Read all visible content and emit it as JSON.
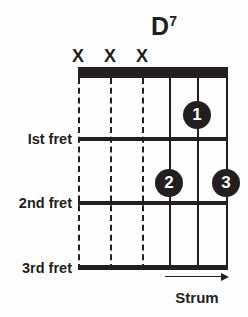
{
  "diagram": {
    "kind": "guitar-chord-diagram",
    "title": {
      "root": "D",
      "superscript": "7",
      "full": "D7"
    },
    "colors": {
      "ink": "#231f20",
      "background": "#fdfdfd",
      "dot_text": "#ffffff"
    },
    "strings": [
      {
        "index": 1,
        "x": 78,
        "style": "dashed",
        "marker": "X",
        "label": "X"
      },
      {
        "index": 2,
        "x": 110,
        "style": "dashed",
        "marker": "X",
        "label": "X"
      },
      {
        "index": 3,
        "x": 142,
        "style": "dashed",
        "marker": "X",
        "label": "X"
      },
      {
        "index": 4,
        "x": 169,
        "style": "solid",
        "marker": "",
        "label": ""
      },
      {
        "index": 5,
        "x": 197,
        "style": "solid",
        "marker": "",
        "label": ""
      },
      {
        "index": 6,
        "x": 226,
        "style": "solid",
        "marker": "",
        "label": ""
      }
    ],
    "nut": {
      "x": 78,
      "y": 67,
      "width": 150,
      "height": 11
    },
    "frets": [
      {
        "number": 1,
        "label": "Ist fret",
        "y": 137,
        "thickness": 4
      },
      {
        "number": 2,
        "label": "2nd fret",
        "y": 201,
        "thickness": 4
      },
      {
        "number": 3,
        "label": "3rd fret",
        "y": 265,
        "thickness": 5
      }
    ],
    "finger_dots": [
      {
        "finger": "1",
        "string": 5,
        "x": 197,
        "y": 115
      },
      {
        "finger": "2",
        "string": 4,
        "x": 169,
        "y": 183
      },
      {
        "finger": "3",
        "string": 6,
        "x": 226,
        "y": 183
      }
    ],
    "strum": {
      "label": "Strum",
      "direction": "right",
      "arrow_x": 165,
      "arrow_y": 277,
      "arrow_width": 64
    }
  }
}
